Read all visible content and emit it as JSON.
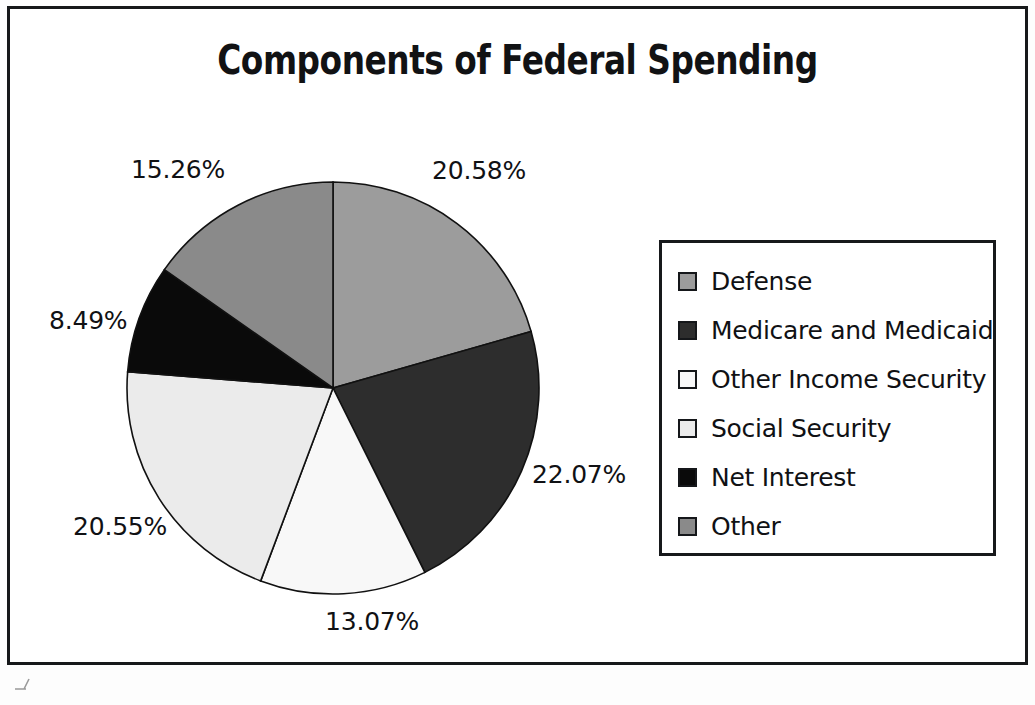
{
  "figure": {
    "title": "Components of Federal Spending",
    "frame_color": "#16181a",
    "background_color": "#ffffff"
  },
  "chart_data": {
    "type": "pie",
    "title": "Components of Federal Spending",
    "xlabel": "",
    "ylabel": "",
    "units": "percent",
    "start_angle_deg": 0,
    "direction": "clockwise",
    "legend_position": "right",
    "grid": false,
    "categories": [
      "Defense",
      "Medicare and Medicaid",
      "Other Income Security",
      "Social Security",
      "Net Interest",
      "Other"
    ],
    "values": [
      20.58,
      22.07,
      13.07,
      20.55,
      8.49,
      15.26
    ],
    "value_labels": [
      "20.58%",
      "22.07%",
      "13.07%",
      "20.55%",
      "8.49%",
      "15.26%"
    ],
    "colors": [
      "#9c9c9c",
      "#2d2d2d",
      "#f8f8f8",
      "#ebebeb",
      "#0a0a0a",
      "#8a8a8a"
    ],
    "slice_border_color": "#111111",
    "total": 100.02
  },
  "pie": {
    "labels": [
      {
        "text": "20.58%",
        "left": 432,
        "top": 156
      },
      {
        "text": "22.07%",
        "left": 532,
        "top": 460
      },
      {
        "text": "13.07%",
        "left": 325,
        "top": 607
      },
      {
        "text": "20.55%",
        "left": 73,
        "top": 512
      },
      {
        "text": "8.49%",
        "left": 49,
        "top": 306
      },
      {
        "text": "15.26%",
        "left": 131,
        "top": 155
      }
    ]
  },
  "legend": {
    "items": [
      {
        "label": "Defense",
        "color": "#9c9c9c"
      },
      {
        "label": "Medicare and Medicaid",
        "color": "#2d2d2d"
      },
      {
        "label": "Other Income Security",
        "color": "#f8f8f8"
      },
      {
        "label": "Social Security",
        "color": "#ebebeb"
      },
      {
        "label": "Net Interest",
        "color": "#0a0a0a"
      },
      {
        "label": "Other",
        "color": "#8a8a8a"
      }
    ]
  }
}
